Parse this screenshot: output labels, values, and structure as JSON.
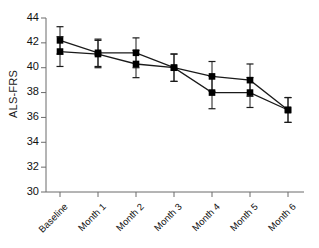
{
  "chart_data": {
    "type": "line",
    "title": "",
    "subtitle": "",
    "xlabel": "",
    "ylabel": "ALS-FRS",
    "categories": [
      "Baseline",
      "Month 1",
      "Month 2",
      "Month 3",
      "Month 4",
      "Month 5",
      "Month 6"
    ],
    "ylim": [
      30,
      44
    ],
    "ytick_values": [
      30,
      32,
      34,
      36,
      38,
      40,
      42,
      44
    ],
    "ytick_labels": [
      "30",
      "32",
      "34",
      "36",
      "38",
      "40",
      "42",
      "44"
    ],
    "grid": false,
    "legend": "none",
    "marker": "filled-square",
    "errorbars": true,
    "series": [
      {
        "name": "series-1",
        "values": [
          42.2,
          41.2,
          41.2,
          40.0,
          39.3,
          39.0,
          36.6
        ],
        "err_low": [
          1.1,
          1.1,
          1.2,
          1.1,
          1.2,
          1.3,
          1.0
        ],
        "err_high": [
          1.1,
          1.1,
          1.2,
          1.1,
          1.2,
          1.3,
          1.0
        ]
      },
      {
        "name": "series-2",
        "values": [
          41.3,
          41.1,
          40.3,
          40.0,
          38.0,
          38.0,
          36.6
        ],
        "err_low": [
          1.2,
          1.1,
          1.1,
          1.1,
          1.3,
          1.2,
          1.0
        ],
        "err_high": [
          1.2,
          1.1,
          1.1,
          1.1,
          1.3,
          1.2,
          1.0
        ]
      }
    ],
    "colors": {
      "line": "#1a1a1a",
      "marker": "#000000",
      "axis": "#6b6b6b",
      "text": "#111111",
      "background": "#ffffff"
    }
  }
}
